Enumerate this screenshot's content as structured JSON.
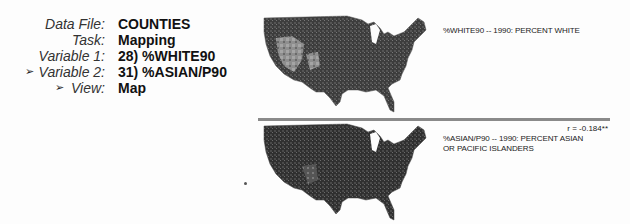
{
  "info": {
    "rows": [
      {
        "label": "Data File:",
        "value": "COUNTIES",
        "selected": false
      },
      {
        "label": "Task:",
        "value": "Mapping",
        "selected": false
      },
      {
        "label": "Variable 1:",
        "value": "28) %WHITE90",
        "selected": false
      },
      {
        "label": "Variable 2:",
        "value": "31) %ASIAN/P90",
        "selected": true
      },
      {
        "label": "View:",
        "value": "Map",
        "selected": true
      }
    ],
    "pointer_icon": "➢"
  },
  "maps": [
    {
      "caption": "%WHITE90 -- 1990: PERCENT WHITE",
      "fill_dark": "#3a3a3a",
      "fill_light": "#9a9a9a"
    },
    {
      "caption_line1": "%ASIAN/P90 -- 1990: PERCENT ASIAN",
      "caption_line2": "OR PACIFIC ISLANDERS",
      "fill_dark": "#2e2e2e",
      "fill_light": "#7a7a7a"
    }
  ],
  "correlation": "r = -0.184**"
}
